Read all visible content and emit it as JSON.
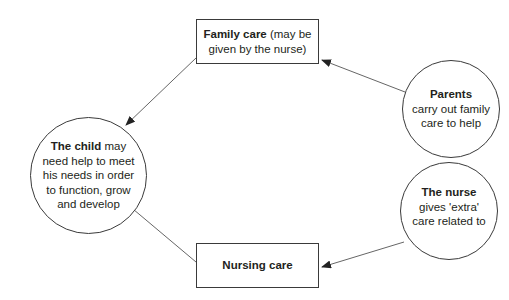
{
  "diagram": {
    "type": "concept-cycle",
    "nodes": {
      "child": {
        "bold": "The child",
        "text": " may need help to meet his needs in order to function, grow and develop"
      },
      "family_care": {
        "bold": "Family care",
        "text": " (may be given by the nurse)"
      },
      "parents": {
        "bold": "Parents",
        "text": "carry out family care to help"
      },
      "nurse": {
        "bold": "The nurse",
        "text": "gives 'extra' care related to"
      },
      "nursing_care": {
        "bold": "Nursing care",
        "text": ""
      }
    },
    "edges": [
      {
        "from": "parents",
        "to": "family_care"
      },
      {
        "from": "family_care",
        "to": "child"
      },
      {
        "from": "nurse",
        "to": "nursing_care"
      },
      {
        "from": "nursing_care",
        "to": "child"
      }
    ],
    "colors": {
      "line": "#555555",
      "border": "#3a3a3a",
      "text": "#231f20"
    }
  }
}
